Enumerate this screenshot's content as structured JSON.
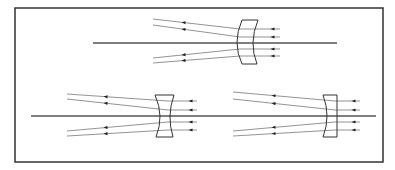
{
  "diagram": {
    "title": "",
    "colors": {
      "frame": "#333333",
      "axis": "#555555",
      "ray": "#777777",
      "lens": "#333333",
      "arrow": "#222222",
      "background": "#ffffff"
    },
    "frame": {
      "x": 15,
      "y": 8,
      "w": 368,
      "h": 154
    },
    "lenses": [
      {
        "id": "meniscus",
        "type": "negative-meniscus",
        "axis": {
          "x1": 93,
          "x2": 337,
          "y": 43
        },
        "outline": {
          "top_left": [
            242,
            20
          ],
          "top_right": [
            258,
            20
          ],
          "bottom_left": [
            242,
            64
          ],
          "bottom_right": [
            257,
            64
          ],
          "left_mid": [
            237,
            43
          ],
          "right_mid": [
            253,
            43
          ]
        },
        "rays": [
          {
            "x1": 153,
            "y1": 19,
            "x2": 240,
            "y2": 29,
            "x3": 280,
            "y3": 29
          },
          {
            "x1": 153,
            "y1": 25,
            "x2": 240,
            "y2": 37,
            "x3": 280,
            "y3": 37
          },
          {
            "x1": 153,
            "y1": 58,
            "x2": 240,
            "y2": 49,
            "x3": 280,
            "y3": 49
          },
          {
            "x1": 153,
            "y1": 63,
            "x2": 240,
            "y2": 56,
            "x3": 280,
            "y3": 56
          }
        ],
        "arrows_left_x": 184,
        "arrows_right_x": 273
      },
      {
        "id": "biconcave",
        "type": "biconcave",
        "axis": {
          "x1": 31,
          "x2": 218,
          "y": 116
        },
        "outline": {
          "top_left": [
            155,
            95
          ],
          "top_right": [
            174,
            95
          ],
          "bottom_left": [
            156,
            137
          ],
          "bottom_right": [
            173,
            137
          ],
          "left_mid": [
            160,
            116
          ],
          "right_mid": [
            170,
            116
          ]
        },
        "rays": [
          {
            "x1": 67,
            "y1": 94,
            "x2": 168,
            "y2": 101,
            "x3": 197,
            "y3": 101
          },
          {
            "x1": 67,
            "y1": 99,
            "x2": 168,
            "y2": 110,
            "x3": 197,
            "y3": 110
          },
          {
            "x1": 67,
            "y1": 131,
            "x2": 168,
            "y2": 122,
            "x3": 197,
            "y3": 122
          },
          {
            "x1": 67,
            "y1": 136,
            "x2": 168,
            "y2": 130,
            "x3": 197,
            "y3": 130
          }
        ],
        "arrows_left_x": 106,
        "arrows_right_x": 191
      },
      {
        "id": "plano-concave",
        "type": "plano-concave",
        "axis": {
          "x1": 218,
          "x2": 376,
          "y": 116
        },
        "outline": {
          "top_left": [
            323,
            95
          ],
          "top_right": [
            337,
            95
          ],
          "bottom_left": [
            323,
            137
          ],
          "bottom_right": [
            337,
            137
          ],
          "left_mid": [
            327,
            116
          ],
          "right_mid": [
            337,
            116
          ]
        },
        "rays": [
          {
            "x1": 233,
            "y1": 92,
            "x2": 335,
            "y2": 101,
            "x3": 360,
            "y3": 101
          },
          {
            "x1": 233,
            "y1": 99,
            "x2": 335,
            "y2": 110,
            "x3": 360,
            "y3": 110
          },
          {
            "x1": 233,
            "y1": 131,
            "x2": 335,
            "y2": 122,
            "x3": 360,
            "y3": 122
          },
          {
            "x1": 233,
            "y1": 136,
            "x2": 335,
            "y2": 130,
            "x3": 360,
            "y3": 130
          }
        ],
        "arrows_left_x": 274,
        "arrows_right_x": 354
      }
    ]
  }
}
